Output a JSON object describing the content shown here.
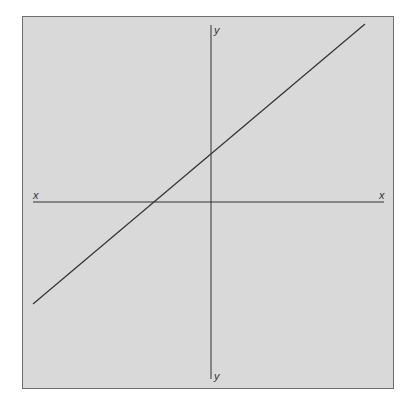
{
  "chart_data": {
    "type": "line",
    "title": "",
    "xlabel": "x",
    "ylabel": "y",
    "axis_labels": {
      "x_left": "x",
      "x_right": "x",
      "y_top": "y",
      "y_bottom": "y"
    },
    "grid": false,
    "legend": null,
    "series": [
      {
        "name": "linear function",
        "description": "Straight line with positive slope, positive y-intercept and negative x-intercept",
        "points_px": [
          [
            33,
            304
          ],
          [
            365,
            24
          ]
        ],
        "y_intercept_px": [
          211,
          153
        ],
        "x_intercept_px": [
          152,
          202
        ]
      }
    ],
    "axes": {
      "x_axis": {
        "y_px": 202,
        "x_start_px": 33,
        "x_end_px": 384
      },
      "y_axis": {
        "x_px": 211,
        "y_start_px": 25,
        "y_end_px": 379
      }
    },
    "colors": {
      "background": "#d9d9d9",
      "border": "#6e6e6e",
      "line": "#333333"
    }
  }
}
